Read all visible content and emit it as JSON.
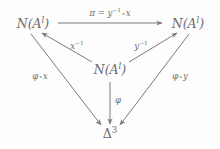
{
  "diagram": {
    "kind": "commutative-diagram",
    "background_color": "#fdfdfd",
    "ink_color": "#6b6b6b",
    "width": 220,
    "height": 149,
    "nodes": [
      {
        "id": "top-left",
        "base": "N(A",
        "superscript": "l",
        "close": ")",
        "x": 33,
        "y": 24
      },
      {
        "id": "top-right",
        "base": "N(A",
        "superscript": "l",
        "close": ")",
        "x": 188,
        "y": 24
      },
      {
        "id": "center",
        "base": "N(A",
        "superscript": "l",
        "close": ")",
        "x": 110,
        "y": 70
      },
      {
        "id": "bottom",
        "base": "Δ",
        "superscript": "3",
        "close": "",
        "x": 110,
        "y": 134
      }
    ],
    "labels": {
      "pi": {
        "pi_symbol": "π",
        "equals": "=",
        "y": "y",
        "y_exp": "−1",
        "circ": "∘",
        "x": "x",
        "full": "π = y⁻¹ ∘ x"
      },
      "x_inverse": {
        "base": "x",
        "exp": "−1",
        "full": "x⁻¹"
      },
      "y_inverse": {
        "base": "y",
        "exp": "−1",
        "full": "y⁻¹"
      },
      "phi_circ_x": {
        "phi": "φ",
        "circ": "∘",
        "arg": "x",
        "full": "φ ∘ x"
      },
      "phi_circ_y": {
        "phi": "φ",
        "circ": "∘",
        "arg": "y",
        "full": "φ ∘ y"
      },
      "phi": {
        "phi": "φ",
        "full": "φ"
      }
    },
    "arrows": [
      {
        "id": "top-left-to-top-right",
        "label": "pi",
        "from": "top-left",
        "to": "top-right",
        "direction": "right"
      },
      {
        "id": "center-to-top-left",
        "label": "x_inverse",
        "from": "center",
        "to": "top-left",
        "direction": "up-left"
      },
      {
        "id": "center-to-top-right",
        "label": "y_inverse",
        "from": "center",
        "to": "top-right",
        "direction": "up-right"
      },
      {
        "id": "top-left-to-bottom",
        "label": "phi_circ_x",
        "from": "top-left",
        "to": "bottom",
        "direction": "down-right"
      },
      {
        "id": "top-right-to-bottom",
        "label": "phi_circ_y",
        "from": "top-right",
        "to": "bottom",
        "direction": "down-left"
      },
      {
        "id": "center-to-bottom",
        "label": "phi",
        "from": "center",
        "to": "bottom",
        "direction": "down"
      }
    ]
  }
}
